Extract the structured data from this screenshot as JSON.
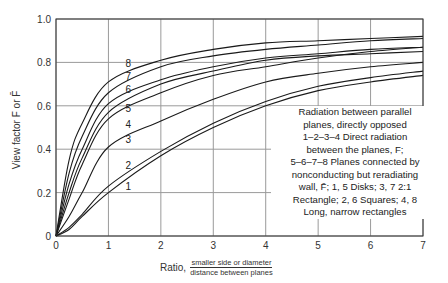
{
  "chart_data": {
    "type": "line",
    "title": "",
    "xlabel": "Ratio,",
    "xlabel_fraction": {
      "numerator": "smaller side or diameter",
      "denominator": "distance between planes"
    },
    "ylabel": "View factor F or F̄",
    "xlim": [
      0,
      7
    ],
    "ylim": [
      0,
      1.0
    ],
    "grid": true,
    "x_ticks": [
      "0",
      "1",
      "2",
      "3",
      "4",
      "5",
      "6",
      "7"
    ],
    "y_ticks": [
      "0",
      "0.2",
      "0.4",
      "0.6",
      "0.8",
      "1.0"
    ],
    "x": [
      0,
      0.25,
      0.5,
      1,
      2,
      3,
      4,
      5,
      6,
      7
    ],
    "series": [
      {
        "name": "1",
        "description": "Disks, direct radiation F",
        "values": [
          0,
          0.03,
          0.09,
          0.2,
          0.37,
          0.5,
          0.6,
          0.67,
          0.71,
          0.74
        ]
      },
      {
        "name": "2",
        "description": "Squares, direct radiation F",
        "values": [
          0,
          0.04,
          0.1,
          0.23,
          0.39,
          0.52,
          0.62,
          0.69,
          0.73,
          0.76
        ]
      },
      {
        "name": "3",
        "description": "2:1 Rectangle, direct radiation F",
        "values": [
          0,
          0.09,
          0.2,
          0.41,
          0.53,
          0.63,
          0.71,
          0.75,
          0.78,
          0.8
        ]
      },
      {
        "name": "4",
        "description": "Long, narrow rectangles, direct radiation F",
        "values": [
          0,
          0.17,
          0.33,
          0.54,
          0.66,
          0.74,
          0.78,
          0.82,
          0.85,
          0.87
        ]
      },
      {
        "name": "5",
        "description": "Disks, reradiating walls F̄",
        "values": [
          0,
          0.2,
          0.36,
          0.57,
          0.7,
          0.76,
          0.81,
          0.83,
          0.84,
          0.85
        ]
      },
      {
        "name": "6",
        "description": "Squares, reradiating walls F̄",
        "values": [
          0,
          0.24,
          0.4,
          0.61,
          0.72,
          0.78,
          0.82,
          0.84,
          0.86,
          0.87
        ]
      },
      {
        "name": "7",
        "description": "2:1 Rectangle, reradiating walls F̄",
        "values": [
          0,
          0.29,
          0.46,
          0.66,
          0.78,
          0.83,
          0.86,
          0.88,
          0.9,
          0.91
        ]
      },
      {
        "name": "8",
        "description": "Long, narrow rectangles, reradiating walls F̄",
        "values": [
          0,
          0.35,
          0.52,
          0.71,
          0.81,
          0.86,
          0.89,
          0.9,
          0.91,
          0.92
        ]
      }
    ],
    "curve_labels": [
      {
        "label": "8",
        "x": 1.38,
        "y": 0.78
      },
      {
        "label": "7",
        "x": 1.38,
        "y": 0.72
      },
      {
        "label": "6",
        "x": 1.38,
        "y": 0.66
      },
      {
        "label": "5",
        "x": 1.38,
        "y": 0.57
      },
      {
        "label": "4",
        "x": 1.38,
        "y": 0.5
      },
      {
        "label": "3",
        "x": 1.38,
        "y": 0.43
      },
      {
        "label": "2",
        "x": 1.38,
        "y": 0.31
      },
      {
        "label": "1",
        "x": 1.38,
        "y": 0.21
      }
    ],
    "annotation": {
      "lines": [
        "Radiation between parallel",
        "planes, directly opposed",
        "1–2–3–4 Direct radiation",
        "between the planes, F;",
        "5–6–7–8 Planes connected by",
        "nonconducting but reradiating",
        "wall, F̄; 1, 5 Disks; 3, 7 2:1",
        "Rectangle; 2, 6 Squares; 4, 8",
        "Long, narrow rectangles"
      ]
    },
    "colors": {
      "line": "#1a1a1a",
      "grid": "#9a9a9a",
      "axis": "#333333"
    }
  }
}
